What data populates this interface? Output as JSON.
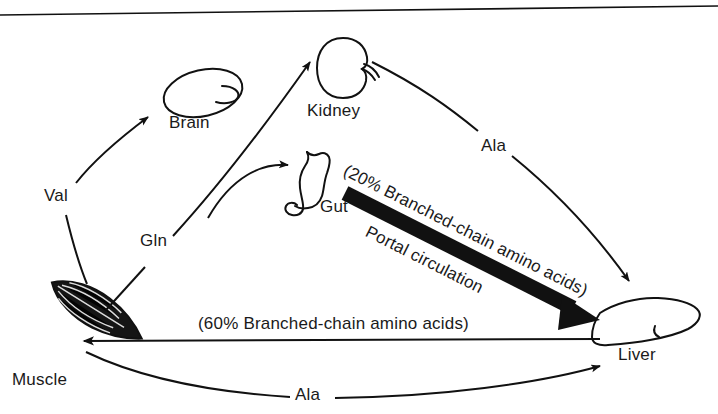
{
  "figure": {
    "background_color": "#ffffff",
    "ink_color": "#111111",
    "top_rule": "horizontal-rule"
  },
  "organs": [
    {
      "id": "brain",
      "label": "Brain",
      "icon": "brain-organ-icon"
    },
    {
      "id": "kidney",
      "label": "Kidney",
      "icon": "kidney-organ-icon"
    },
    {
      "id": "gut",
      "label": "Gut",
      "icon": "gut-organ-icon"
    },
    {
      "id": "liver",
      "label": "Liver",
      "icon": "liver-organ-icon"
    },
    {
      "id": "muscle",
      "label": "Muscle",
      "icon": "muscle-organ-icon"
    }
  ],
  "flow_labels": {
    "val": "Val",
    "gln": "Gln",
    "ala_kidney_liver": "Ala",
    "ala_muscle_liver": "Ala",
    "portal_percent": "(20% Branched-chain amino acids)",
    "portal_circulation": "Portal circulation",
    "systemic_percent": "(60% Branched-chain amino acids)"
  },
  "arrows": [
    {
      "id": "muscle-to-brain",
      "label": "Val",
      "style": "thin-curved"
    },
    {
      "id": "muscle-to-kidney",
      "label": "Gln",
      "style": "thin-curved"
    },
    {
      "id": "gln-branch-to-gut",
      "label": "Gln",
      "style": "thin-curved"
    },
    {
      "id": "kidney-to-liver",
      "label": "Ala",
      "style": "thin-curved"
    },
    {
      "id": "gut-to-liver",
      "label": "Portal circulation",
      "style": "thick-solid-black"
    },
    {
      "id": "liver-to-muscle",
      "label": "(60% Branched-chain amino acids)",
      "style": "thin-straight"
    },
    {
      "id": "muscle-to-liver",
      "label": "Ala",
      "style": "thin-curved"
    }
  ]
}
